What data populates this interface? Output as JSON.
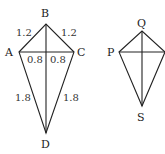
{
  "figures": [
    {
      "name": "kite-ABCD",
      "vertices": {
        "A": {
          "label": "A",
          "x": 19,
          "y": 52
        },
        "B": {
          "label": "B",
          "x": 46,
          "y": 24
        },
        "C": {
          "label": "C",
          "x": 74,
          "y": 52
        },
        "D": {
          "label": "D",
          "x": 46,
          "y": 133
        }
      },
      "edge_labels": {
        "AB": "1.2",
        "BC": "1.2",
        "AO": "0.8",
        "OC": "0.8",
        "AD": "1.8",
        "CD": "1.8"
      }
    },
    {
      "name": "kite-PQRS",
      "vertices": {
        "P": {
          "label": "P",
          "x": 119,
          "y": 52
        },
        "Q": {
          "label": "Q",
          "x": 142,
          "y": 31
        },
        "R": {
          "label": "",
          "x": 165,
          "y": 52
        },
        "S": {
          "label": "S",
          "x": 142,
          "y": 106
        }
      }
    }
  ],
  "colors": {
    "stroke": "#222222",
    "background": "#ffffff"
  }
}
